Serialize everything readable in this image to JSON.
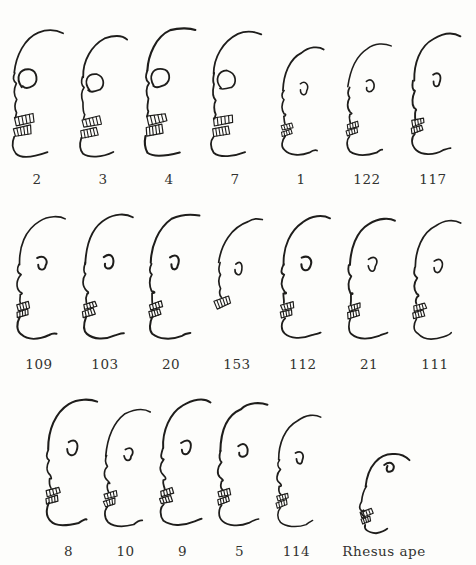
{
  "figure": {
    "ink_color": "#1e1d1b",
    "label_color": "#333330",
    "background": "#fdfdfb",
    "rows": [
      {
        "name": "row-1",
        "figures": [
          {
            "label": "2",
            "variant": "skull",
            "size": 0.97
          },
          {
            "label": "3",
            "variant": "skull",
            "size": 0.93
          },
          {
            "label": "4",
            "variant": "skull",
            "size": 0.99
          },
          {
            "label": "7",
            "variant": "skull",
            "size": 0.96
          },
          {
            "label": "1",
            "variant": "profile",
            "size": 0.86
          },
          {
            "label": "122",
            "variant": "profile",
            "size": 0.88
          },
          {
            "label": "117",
            "variant": "profile",
            "size": 0.96
          }
        ]
      },
      {
        "name": "row-2",
        "figures": [
          {
            "label": "109",
            "variant": "profile",
            "size": 0.97
          },
          {
            "label": "103",
            "variant": "profile",
            "size": 0.99
          },
          {
            "label": "20",
            "variant": "profile",
            "size": 0.98
          },
          {
            "label": "153",
            "variant": "fragment",
            "size": 0.95
          },
          {
            "label": "112",
            "variant": "profile",
            "size": 0.97
          },
          {
            "label": "21",
            "variant": "profile",
            "size": 0.96
          },
          {
            "label": "111",
            "variant": "profile",
            "size": 0.94
          }
        ]
      },
      {
        "name": "row-3",
        "figures": [
          {
            "label": "8",
            "variant": "profile",
            "size": 1.0
          },
          {
            "label": "10",
            "variant": "profile",
            "size": 0.92
          },
          {
            "label": "9",
            "variant": "profile",
            "size": 1.0
          },
          {
            "label": "5",
            "variant": "profile",
            "size": 0.97
          },
          {
            "label": "114",
            "variant": "profile",
            "size": 0.88
          },
          {
            "label": "Rhesus ape",
            "variant": "ape",
            "size": 0.95
          }
        ]
      }
    ]
  }
}
